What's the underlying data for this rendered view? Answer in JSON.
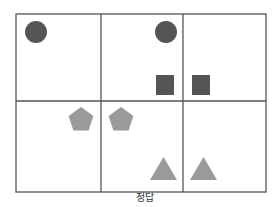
{
  "caption": "정답",
  "colors": {
    "grid_line": "#555555",
    "dark_shape": "#555555",
    "light_shape": "#9a9a9a",
    "background": "#ffffff"
  },
  "grid": {
    "rows": 2,
    "cols": 3,
    "x": [
      16,
      101,
      183,
      266
    ],
    "y": [
      14,
      101,
      192
    ]
  },
  "shapes": [
    {
      "type": "circle",
      "cell": "r1c1",
      "color": "dark",
      "cx": 36,
      "cy": 32,
      "r": 11
    },
    {
      "type": "circle",
      "cell": "r1c2",
      "color": "dark",
      "cx": 166,
      "cy": 32,
      "r": 11
    },
    {
      "type": "square",
      "cell": "r1c2",
      "color": "dark",
      "x": 156,
      "y": 75,
      "w": 18,
      "h": 20
    },
    {
      "type": "square",
      "cell": "r1c3",
      "color": "dark",
      "x": 192,
      "y": 75,
      "w": 18,
      "h": 20
    },
    {
      "type": "pentagon",
      "cell": "r2c1",
      "color": "light",
      "cx": 81,
      "cy": 120,
      "r": 13
    },
    {
      "type": "pentagon",
      "cell": "r2c2",
      "color": "light",
      "cx": 121,
      "cy": 120,
      "r": 13
    },
    {
      "type": "triangle",
      "cell": "r2c2",
      "color": "light",
      "x": 150,
      "y": 157,
      "w": 27,
      "h": 23
    },
    {
      "type": "triangle",
      "cell": "r2c3",
      "color": "light",
      "x": 190,
      "y": 157,
      "w": 27,
      "h": 23
    }
  ]
}
